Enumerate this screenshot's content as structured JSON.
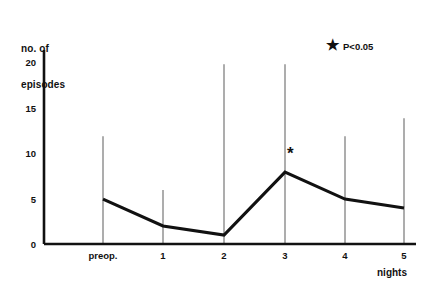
{
  "chart_data": {
    "type": "line",
    "title": "",
    "xlabel": "nights",
    "ylabel": "no. of episodes",
    "ylabel_line1": "no. of",
    "ylabel_line2": "episodes",
    "categories": [
      "preop.",
      "1",
      "2",
      "3",
      "4",
      "5"
    ],
    "values": [
      5,
      2,
      1,
      8,
      5,
      4
    ],
    "error_bar_tops": [
      12,
      6,
      20,
      20,
      12,
      14
    ],
    "error_bar_bottoms": [
      0,
      0,
      0,
      0,
      0,
      0
    ],
    "yticks": [
      0,
      5,
      10,
      15,
      20
    ],
    "ytick_labels": [
      "0",
      "5",
      "10",
      "15",
      "20"
    ],
    "ylim": [
      0,
      20.7
    ],
    "grid": false,
    "legend_position": "top-right",
    "annotations": [
      {
        "name": "significance-star",
        "text": "*",
        "category": "3",
        "value": 8
      }
    ],
    "legend": [
      {
        "marker": "★",
        "label": "P<0.05"
      }
    ],
    "line_color": "#111111",
    "errorbar_color": "#8a8a8a",
    "axis_color": "#111111",
    "background_color": "#ffffff"
  },
  "legend": {
    "star_glyph": "★",
    "text": "P<0.05"
  },
  "axes": {
    "y_title_line1": "no. of",
    "y_title_line2": "episodes",
    "x_title": "nights"
  }
}
